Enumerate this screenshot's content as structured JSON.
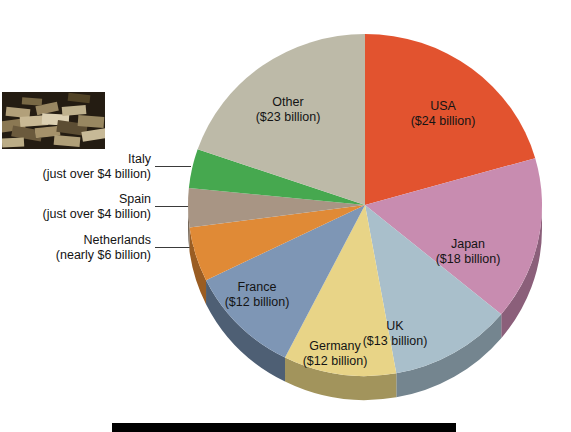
{
  "chart_data": {
    "type": "pie",
    "title": "",
    "unit": "billion US dollars",
    "total": 116.6,
    "legend": "none (direct slice labels and leader-line callouts)",
    "categories": [
      "USA",
      "Japan",
      "UK",
      "Germany",
      "France",
      "Netherlands",
      "Spain",
      "Italy",
      "Other"
    ],
    "values": [
      24,
      18,
      13,
      12,
      12,
      6,
      4.3,
      4.3,
      23
    ],
    "start_angle_deg": 0,
    "direction": "clockwise",
    "slices": [
      {
        "name": "USA",
        "label": "USA",
        "value_label": "($24 billion)",
        "value": 24,
        "color": "#e2532f",
        "side_color": "#9d3a21",
        "label_placement": "inside",
        "label_x": 443,
        "label_y": 110
      },
      {
        "name": "Japan",
        "label": "Japan",
        "value_label": "($18 billion)",
        "value": 18,
        "color": "#c88cb0",
        "side_color": "#8b5f7a",
        "label_placement": "inside",
        "label_y": 248,
        "label_x": 468
      },
      {
        "name": "UK",
        "label": "UK",
        "value_label": "($13 billion)",
        "value": 13,
        "color": "#a9bfcb",
        "side_color": "#74858f",
        "label_placement": "inside",
        "label_x": 395,
        "label_y": 330
      },
      {
        "name": "Germany",
        "label": "Germany",
        "value_label": "($12 billion)",
        "value": 12,
        "color": "#e8d487",
        "side_color": "#a2945c",
        "label_placement": "inside",
        "label_x": 335,
        "label_y": 350
      },
      {
        "name": "France",
        "label": "France",
        "value_label": "($12 billion)",
        "value": 12,
        "color": "#7e96b5",
        "side_color": "#4e5f74",
        "label_placement": "inside",
        "label_x": 257,
        "label_y": 291
      },
      {
        "name": "Netherlands",
        "label": "Netherlands",
        "value_label": "(nearly $6 billion)",
        "value": 6,
        "color": "#e08a36",
        "side_color": "#9a5d23",
        "label_placement": "callout-left"
      },
      {
        "name": "Spain",
        "label": "Spain",
        "value_label": "(just over $4 billion)",
        "value": 4.3,
        "color": "#a89584",
        "side_color": "#756758",
        "label_placement": "callout-left"
      },
      {
        "name": "Italy",
        "label": "Italy",
        "value_label": "(just over $4 billion)",
        "value": 4.3,
        "color": "#46a84f",
        "side_color": "#2f7336",
        "label_placement": "callout-left"
      },
      {
        "name": "Other",
        "label": "Other",
        "value_label": "($23 billion)",
        "value": 23,
        "color": "#bdbaa8",
        "side_color": "#86846f",
        "label_placement": "inside",
        "label_x": 288,
        "label_y": 106
      }
    ]
  },
  "callouts": {
    "italy": {
      "name": "Italy",
      "value_label": "(just over $4 billion)"
    },
    "spain": {
      "name": "Spain",
      "value_label": "(just over $4 billion)"
    },
    "netherlands": {
      "name": "Netherlands",
      "value_label": "(nearly $6 billion)"
    }
  },
  "photo": {
    "alt_name": "stacked-banknotes-photograph"
  },
  "colors": {
    "background": "#ffffff",
    "text": "#141414",
    "leader_line": "#3a3a3a",
    "caption_bar": "#000000"
  }
}
